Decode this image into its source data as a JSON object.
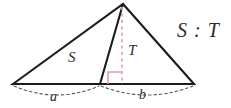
{
  "figure": {
    "type": "geometry-diagram",
    "background_color": "#ffffff",
    "canvas": {
      "width": 231,
      "height": 108
    },
    "stroke_color": "#1c1c1c",
    "altitude_color": "#e8a0ae",
    "right_angle_color": "#e79aab",
    "arc_color": "#5a5a5a",
    "labels": {
      "region_left": "S",
      "region_right": "T",
      "base_left": "a",
      "base_right": "b",
      "ratio": "S : T"
    },
    "points": {
      "apex": {
        "x": 123,
        "y": 4
      },
      "base_left": {
        "x": 13,
        "y": 84
      },
      "base_right": {
        "x": 194,
        "y": 84
      },
      "cevian_foot": {
        "x": 100,
        "y": 84
      },
      "altitude_foot": {
        "x": 122,
        "y": 84
      }
    },
    "segments": [
      {
        "name": "left-side",
        "from": "base_left",
        "to": "apex",
        "style": "solid"
      },
      {
        "name": "right-side",
        "from": "apex",
        "to": "base_right",
        "style": "solid"
      },
      {
        "name": "base",
        "from": "base_left",
        "to": "base_right",
        "style": "solid"
      },
      {
        "name": "cevian",
        "from": "apex",
        "to": "cevian_foot",
        "style": "solid"
      },
      {
        "name": "altitude",
        "from": "apex",
        "to": "altitude_foot",
        "style": "dashed"
      }
    ],
    "arcs": [
      {
        "name": "measure-arc-a",
        "from_x": 14,
        "to_x": 99,
        "label": "a"
      },
      {
        "name": "measure-arc-b",
        "from_x": 101,
        "to_x": 193,
        "label": "b"
      }
    ]
  }
}
